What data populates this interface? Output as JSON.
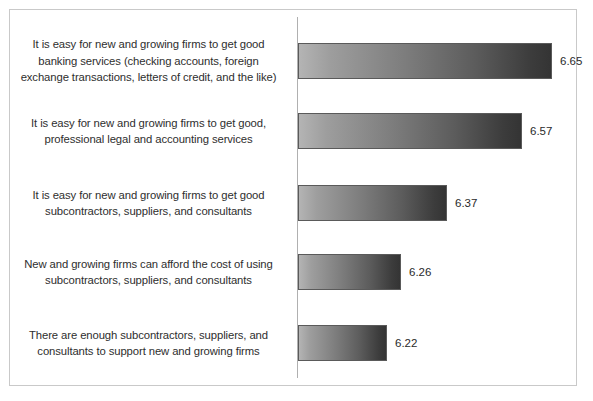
{
  "chart_data": {
    "type": "bar",
    "orientation": "horizontal",
    "title": "",
    "subtitle": "",
    "xlabel": "",
    "ylabel": "",
    "grid": false,
    "legend": false,
    "legend_position": "none",
    "axis_line": "vertical-category-axis",
    "xlim": [
      6.0,
      6.72
    ],
    "value_precision": 2,
    "categories": [
      "It is easy for new and growing firms to get good banking services (checking accounts, foreign exchange transactions, letters of credit, and the like)",
      "It is easy for new and growing firms to get good, professional legal and accounting services",
      "It is easy for new and growing firms to get good subcontractors, suppliers, and consultants",
      "New and growing firms can afford the cost of using subcontractors, suppliers, and consultants",
      "There are enough subcontractors, suppliers, and consultants to support new and growing firms"
    ],
    "values": [
      6.65,
      6.57,
      6.37,
      6.26,
      6.22
    ],
    "value_labels": [
      "6.65",
      "6.57",
      "6.37",
      "6.26",
      "6.22"
    ],
    "colors": {
      "bar_gradient_start": "#b4b4b4",
      "bar_gradient_end": "#343434",
      "bar_outline": "#5a5a5a",
      "axis_line": "#b0b0b0",
      "frame_border": "#c9c9c9",
      "label_text": "#2e2e2e",
      "value_text": "#2a2a2a",
      "background": "#ffffff"
    }
  },
  "bars": [
    {
      "label_lines": [
        "It is easy for new and growing firms to get good",
        "banking services (checking accounts, foreign",
        "exchange transactions, letters of credit, and the like)"
      ],
      "value_label": "6.65",
      "value": 6.65,
      "bar_top": 43,
      "bar_width": 254,
      "label_top": 31
    },
    {
      "label_lines": [
        "It is easy for new and growing firms to get good,",
        "professional legal and accounting services"
      ],
      "value_label": "6.57",
      "value": 6.57,
      "bar_top": 113,
      "bar_width": 224,
      "label_top": 113
    },
    {
      "label_lines": [
        "It is easy for new and growing firms to get good",
        "subcontractors, suppliers, and consultants"
      ],
      "value_label": "6.37",
      "value": 6.37,
      "bar_top": 185,
      "bar_width": 149,
      "label_top": 185
    },
    {
      "label_lines": [
        "New and growing firms can afford the cost of using",
        "subcontractors, suppliers, and consultants"
      ],
      "value_label": "6.26",
      "value": 6.26,
      "bar_top": 254,
      "bar_width": 103,
      "label_top": 254
    },
    {
      "label_lines": [
        "There are enough subcontractors, suppliers, and",
        "consultants to support new and growing firms"
      ],
      "value_label": "6.22",
      "value": 6.22,
      "bar_top": 325,
      "bar_width": 89,
      "label_top": 325
    }
  ]
}
